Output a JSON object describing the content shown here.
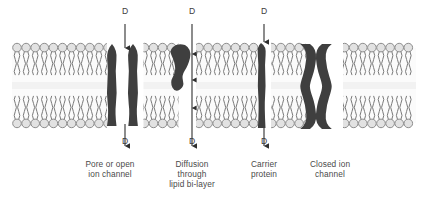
{
  "diagram": {
    "colors": {
      "background": "#ffffff",
      "protein": "#3f3f3f",
      "lipid_head_fill": "#e2e2e2",
      "lipid_head_stroke": "#8d8d8d",
      "lipid_tail": "#7a7a7a",
      "midline": "#f2f2f2",
      "arrow": "#2e2e2e",
      "text": "#4a4a4a"
    },
    "membrane": {
      "label": "phospholipid-bilayer",
      "left": 12,
      "right": 416,
      "top": 43,
      "bottom": 128,
      "leaflets": 2
    },
    "solute_symbol": "D",
    "markers": {
      "top": [
        {
          "name": "pore-top-D",
          "text": "D",
          "x": 125,
          "y": 12
        },
        {
          "name": "diffusion-top-D",
          "text": "D",
          "x": 192,
          "y": 12
        },
        {
          "name": "carrier-top-D",
          "text": "D",
          "x": 264,
          "y": 12
        }
      ],
      "bottom": [
        {
          "name": "pore-bottom-D",
          "text": "D",
          "x": 125,
          "y": 140
        },
        {
          "name": "diffusion-bottom-D",
          "text": "D",
          "x": 192,
          "y": 140
        },
        {
          "name": "carrier-bottom-D",
          "text": "D",
          "x": 264,
          "y": 140
        }
      ]
    },
    "structures": [
      {
        "name": "pore-or-open-ion-channel",
        "label_lines": [
          "Pore or open",
          "ion channel"
        ],
        "label_x": 110,
        "label_y": 160,
        "label_width": 92
      },
      {
        "name": "diffusion-through-lipid-bilayer",
        "label_lines": [
          "Diffusion",
          "through",
          "lipid bi-layer"
        ],
        "label_x": 160,
        "label_y": 160,
        "label_width": 66
      },
      {
        "name": "carrier-protein",
        "label_lines": [
          "Carrier",
          "protein"
        ],
        "label_x": 236,
        "label_y": 160,
        "label_width": 56
      },
      {
        "name": "closed-ion-channel",
        "label_lines": [
          "Closed ion",
          "channel"
        ],
        "label_x": 294,
        "label_y": 160,
        "label_width": 72
      }
    ]
  }
}
